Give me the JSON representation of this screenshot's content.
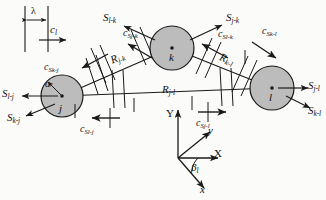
{
  "figure": {
    "type": "technical-vector-diagram",
    "background_color": "#fbfbf9",
    "line_color": "#1a1a1a",
    "circle_fill": "#bcbcbc"
  },
  "inset": {
    "name": "wavelength-inset",
    "lambda_label": "λ",
    "speed_label": "c",
    "speed_sub": "l"
  },
  "bodies": [
    {
      "id": "j",
      "label": "j",
      "cx": 62,
      "cy": 96,
      "r": 21,
      "radius_label": "a"
    },
    {
      "id": "k",
      "label": "k",
      "cx": 172,
      "cy": 48,
      "r": 22
    },
    {
      "id": "l",
      "label": "l",
      "cx": 272,
      "cy": 88,
      "r": 22
    }
  ],
  "distance_labels": [
    {
      "name": "R-j-k",
      "base": "R",
      "sub": "j-k"
    },
    {
      "name": "R-j-l",
      "base": "R",
      "sub": "j-l"
    },
    {
      "name": "R-k-l",
      "base": "R",
      "sub": "k-l"
    }
  ],
  "surface_vectors": [
    {
      "name": "S-l-j",
      "base": "S",
      "sub": "l-j"
    },
    {
      "name": "S-k-j",
      "base": "S",
      "sub": "k-j"
    },
    {
      "name": "S-l-k",
      "base": "S",
      "sub": "l-k"
    },
    {
      "name": "S-j-k",
      "base": "S",
      "sub": "j-k"
    },
    {
      "name": "S-j-l",
      "base": "S",
      "sub": "j-l"
    },
    {
      "name": "S-k-l",
      "base": "S",
      "sub": "k-l"
    }
  ],
  "wave_speed_vectors": [
    {
      "name": "cS-k-j",
      "base": "c",
      "mid": "S",
      "sub": "k-j"
    },
    {
      "name": "cS-l-j",
      "base": "c",
      "mid": "S",
      "sub": "l-j"
    },
    {
      "name": "cS-j-k",
      "base": "c",
      "mid": "S",
      "sub": "j-k"
    },
    {
      "name": "cS-l-k",
      "base": "c",
      "mid": "S",
      "sub": "l-k"
    },
    {
      "name": "cS-k-l",
      "base": "c",
      "mid": "S",
      "sub": "k-l"
    },
    {
      "name": "cS-j-l",
      "base": "c",
      "mid": "S",
      "sub": "j-l"
    }
  ],
  "axes": {
    "global": [
      {
        "name": "axis-Y",
        "label": "Y"
      },
      {
        "name": "axis-X",
        "label": "X"
      }
    ],
    "local": [
      {
        "name": "axis-y-local",
        "label": "y"
      },
      {
        "name": "axis-x-local",
        "label": "x"
      }
    ],
    "angle": {
      "name": "angle-beta-l",
      "base": "β",
      "sub": "l"
    }
  }
}
